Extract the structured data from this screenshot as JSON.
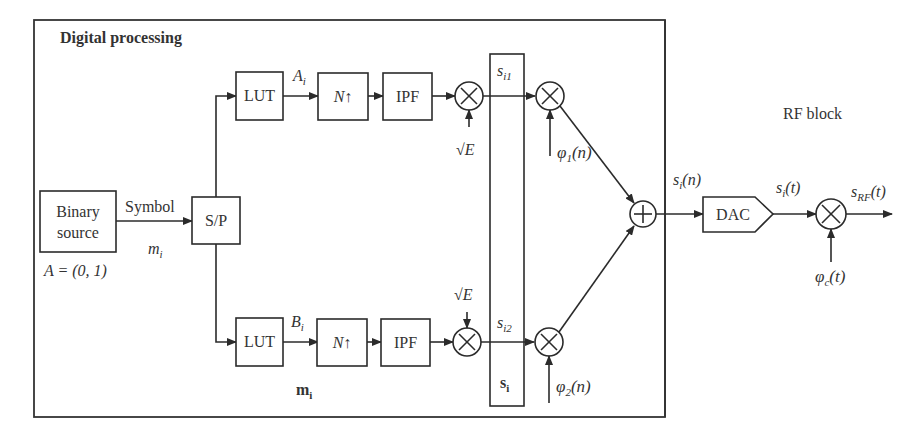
{
  "frame": {
    "title": "Digital processing"
  },
  "rf": {
    "title": "RF block"
  },
  "source": {
    "line1": "Binary",
    "line2": "source",
    "alphabet": "A = (0, 1)"
  },
  "symbol_label": "Symbol",
  "symbol_var": "m",
  "symbol_var_sub": "i",
  "sp": {
    "label": "S/P"
  },
  "top_branch": {
    "lut": "LUT",
    "var": "A",
    "var_sub": "i",
    "upsample": "N↑",
    "filter": "IPF",
    "gain": "√E",
    "out": "s",
    "out_sub": "i1",
    "carrier": "φ",
    "carrier_sub": "1",
    "carrier_arg": "(n)"
  },
  "bottom_branch": {
    "lut": "LUT",
    "var": "B",
    "var_sub": "i",
    "upsample": "N↑",
    "filter": "IPF",
    "gain": "√E",
    "out": "s",
    "out_sub": "i2",
    "carrier": "φ",
    "carrier_sub": "2",
    "carrier_arg": "(n)"
  },
  "vector_m": {
    "main": "m",
    "sub": "i"
  },
  "vector_s": {
    "main": "s",
    "sub": "i"
  },
  "sum_out": {
    "main": "s",
    "sub": "i",
    "arg": "(n)"
  },
  "dac": {
    "label": "DAC"
  },
  "analog": {
    "main": "s",
    "sub": "i",
    "arg": "(t)"
  },
  "rf_out": {
    "main": "s",
    "sub": "RF",
    "arg": "(t)"
  },
  "rf_carrier": {
    "main": "φ",
    "sub": "c",
    "arg": "(t)"
  },
  "colors": {
    "line": "#2b2b2b",
    "text": "#333333",
    "background": "#ffffff"
  }
}
